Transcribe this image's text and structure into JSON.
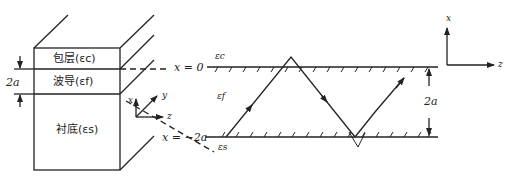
{
  "diagram": {
    "type": "planar-waveguide",
    "left_panel": {
      "layers": [
        {
          "name": "包层",
          "symbol": "(ε_c)",
          "label": "包层(ε꜀)"
        },
        {
          "name": "波导",
          "symbol": "(ε_f)",
          "label": "波导(ε_f)"
        },
        {
          "name": "衬底",
          "symbol": "(ε_s)",
          "label": "衬底(ε_s)"
        }
      ],
      "thickness_label": "2a",
      "axes": {
        "x": "x",
        "y": "y",
        "z": "z"
      }
    },
    "right_panel": {
      "upper_boundary": "x=0",
      "lower_boundary": "x=−2a",
      "upper_medium": "ε_c",
      "guide_medium": "ε_f",
      "lower_medium": "ε_s",
      "thickness_label": "2a",
      "axes": {
        "x": "x",
        "z": "z"
      }
    }
  },
  "text": {
    "layer_top": "包层(εc)",
    "layer_mid": "波导(εf)",
    "layer_bot": "衬底(εs)",
    "thick_left": "2a",
    "axis_x_left": "x",
    "axis_y_left": "y",
    "axis_z_left": "z",
    "eq_top": "x = 0",
    "eq_bot": "x = −2a",
    "eps_c": "εc",
    "eps_f": "εf",
    "eps_s": "εs",
    "thick_right": "2a",
    "axis_x_right": "x",
    "axis_z_right": "z"
  }
}
